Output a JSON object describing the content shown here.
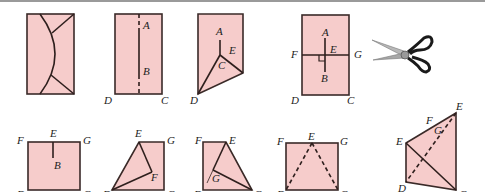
{
  "colors": {
    "paper": "#f6cccb",
    "stroke": "#2e1f1d",
    "top_rule": "#9a9a9a"
  },
  "figures": {
    "fig1": {
      "description": "rectangle with curved cut and two corner cuts",
      "labels": []
    },
    "fig2": {
      "description": "rectangle folded along dashed midline",
      "labels": {
        "A": "A",
        "B": "B",
        "D": "D",
        "C": "C"
      }
    },
    "fig3": {
      "description": "pentagon with crease to point C",
      "labels": {
        "A": "A",
        "E": "E",
        "C": "C",
        "D": "D"
      }
    },
    "fig4": {
      "description": "rectangle with perpendicular creases",
      "labels": {
        "A": "A",
        "E": "E",
        "F": "F",
        "G": "G",
        "B": "B",
        "D": "D",
        "C": "C"
      }
    },
    "fig5": {
      "description": "scissors",
      "icon": "scissors-icon"
    },
    "fig6": {
      "description": "square FGCD with segment EB",
      "labels": {
        "F": "F",
        "E": "E",
        "G": "G",
        "B": "B",
        "D": "D",
        "C": "C"
      }
    },
    "fig7": {
      "description": "folded quadrilateral with point F",
      "labels": {
        "E": "E",
        "G": "G",
        "F": "F",
        "D": "D",
        "C": "C"
      }
    },
    "fig8": {
      "description": "folded quadrilateral with point G",
      "labels": {
        "F": "F",
        "E": "E",
        "G": "G",
        "D": "D",
        "C": "C"
      }
    },
    "fig9": {
      "description": "square with dashed triangle from E",
      "labels": {
        "F": "F",
        "E": "E",
        "G": "G",
        "D": "D",
        "C": "C"
      }
    },
    "fig10": {
      "description": "quadrilateral with diagonals",
      "labels": {
        "E_top": "E",
        "F": "F",
        "G": "G",
        "E_left": "E",
        "D": "D",
        "C": "C"
      }
    }
  }
}
